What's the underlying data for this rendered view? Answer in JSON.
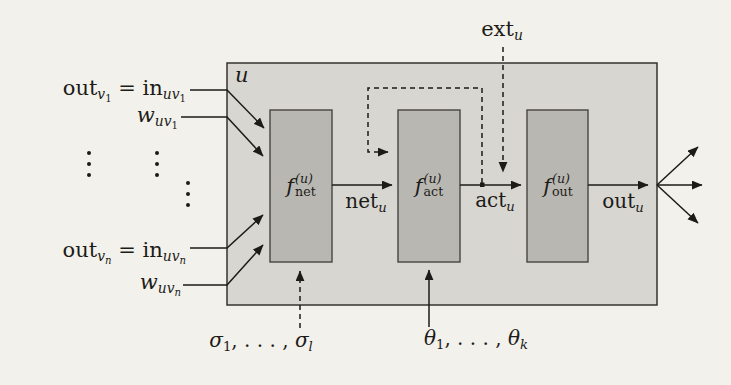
{
  "figure": {
    "colors": {
      "page_bg": "#f3f1eb",
      "outer_box_fill": "#d8d6d1",
      "outer_box_stroke": "#34332f",
      "inner_box_fill": "#b9b7b2",
      "inner_box_stroke": "#47453f",
      "line": "#1c1b18"
    },
    "ellipsis_symbol": "⋮"
  },
  "math": {
    "in_top": [
      {
        "t": "out",
        "s": "rm"
      },
      {
        "t": "v",
        "s": "sub-it"
      },
      {
        "t": "1",
        "s": "ss-rm"
      },
      {
        "t": " = ",
        "s": "rm"
      },
      {
        "t": "in",
        "s": "rm"
      },
      {
        "t": "uv",
        "s": "sub-it"
      },
      {
        "t": "1",
        "s": "ss-rm"
      }
    ],
    "w_top": [
      {
        "t": "w",
        "s": "it"
      },
      {
        "t": "uv",
        "s": "sub-it"
      },
      {
        "t": "1",
        "s": "ss-rm"
      }
    ],
    "in_bottom": [
      {
        "t": "out",
        "s": "rm"
      },
      {
        "t": "v",
        "s": "sub-it"
      },
      {
        "t": "n",
        "s": "ss-it"
      },
      {
        "t": " = ",
        "s": "rm"
      },
      {
        "t": "in",
        "s": "rm"
      },
      {
        "t": "uv",
        "s": "sub-it"
      },
      {
        "t": "n",
        "s": "ss-it"
      }
    ],
    "w_bottom": [
      {
        "t": "w",
        "s": "it"
      },
      {
        "t": "uv",
        "s": "sub-it"
      },
      {
        "t": "n",
        "s": "ss-it"
      }
    ],
    "unit": [
      {
        "t": "u",
        "s": "it"
      }
    ],
    "ext": [
      {
        "t": "ext",
        "s": "rm"
      },
      {
        "t": "u",
        "s": "sub-it"
      }
    ],
    "f_net": [
      {
        "t": "f",
        "s": "it"
      },
      {
        "top": "(u)",
        "bot": "net"
      }
    ],
    "f_act": [
      {
        "t": "f",
        "s": "it"
      },
      {
        "top": "(u)",
        "bot": "act"
      }
    ],
    "f_out": [
      {
        "t": "f",
        "s": "it"
      },
      {
        "top": "(u)",
        "bot": "out"
      }
    ],
    "net": [
      {
        "t": "net",
        "s": "rm"
      },
      {
        "t": "u",
        "s": "sub-it"
      }
    ],
    "act": [
      {
        "t": "act",
        "s": "rm"
      },
      {
        "t": "u",
        "s": "sub-it"
      }
    ],
    "out": [
      {
        "t": "out",
        "s": "rm"
      },
      {
        "t": "u",
        "s": "sub-it"
      }
    ],
    "sigma": [
      {
        "t": "σ",
        "s": "it"
      },
      {
        "t": "1",
        "s": "sub-rm"
      },
      {
        "t": ", . . . , ",
        "s": "rm"
      },
      {
        "t": "σ",
        "s": "it"
      },
      {
        "t": "l",
        "s": "sub-it"
      }
    ],
    "theta": [
      {
        "t": "θ",
        "s": "it"
      },
      {
        "t": "1",
        "s": "sub-rm"
      },
      {
        "t": ", . . . , ",
        "s": "rm"
      },
      {
        "t": "θ",
        "s": "it"
      },
      {
        "t": "k",
        "s": "sub-it"
      }
    ]
  }
}
